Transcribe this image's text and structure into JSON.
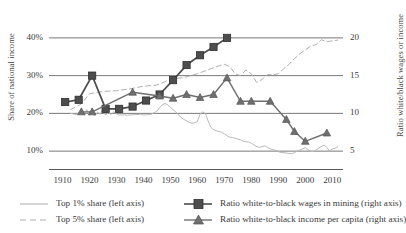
{
  "chart_data": {
    "type": "line",
    "title": "",
    "xlabel": "",
    "ylabel": "Share of national income",
    "y2label": "Ratio white/black wages or income",
    "xlim": [
      1905,
      2014
    ],
    "ylim": [
      5,
      45
    ],
    "y2lim": [
      2.5,
      22.5
    ],
    "grid": true,
    "legend_position": "bottom",
    "left_axis_ticks": [
      "40%",
      "30%",
      "20%",
      "10%"
    ],
    "left_axis_values": [
      40,
      30,
      20,
      10
    ],
    "right_axis_ticks": [
      "20",
      "15",
      "10",
      "5"
    ],
    "right_axis_values": [
      20,
      15,
      10,
      5
    ],
    "x_ticks": [
      "1910",
      "1920",
      "1930",
      "1940",
      "1950",
      "1960",
      "1970",
      "1980",
      "1990",
      "2000",
      "2010"
    ],
    "x_tick_values": [
      1910,
      1920,
      1930,
      1940,
      1950,
      1960,
      1970,
      1980,
      1990,
      2000,
      2010
    ],
    "series": [
      {
        "name": "Top 1% share (left axis)",
        "axis": "left",
        "style": "solid",
        "color": "#b9b9b9",
        "marker": "none",
        "units": "percent of national income",
        "x": [
          1913,
          1915,
          1917,
          1918,
          1919,
          1920,
          1921,
          1922,
          1923,
          1924,
          1925,
          1926,
          1927,
          1928,
          1929,
          1930,
          1931,
          1932,
          1933,
          1934,
          1935,
          1936,
          1937,
          1938,
          1939,
          1940,
          1941,
          1942,
          1943,
          1944,
          1945,
          1946,
          1947,
          1948,
          1949,
          1950,
          1951,
          1952,
          1953,
          1954,
          1955,
          1956,
          1957,
          1958,
          1959,
          1960,
          1961,
          1962,
          1963,
          1964,
          1965,
          1966,
          1967,
          1968,
          1969,
          1970,
          1971,
          1972,
          1973,
          1974,
          1975,
          1976,
          1977,
          1978,
          1979,
          1980,
          1981,
          1982,
          1983,
          1984,
          1985,
          1986,
          1987,
          1988,
          1989,
          1990,
          1991,
          1992,
          1993,
          1994,
          1995,
          1996,
          1997,
          1998,
          1999,
          2000,
          2001,
          2002,
          2003,
          2004,
          2005,
          2006,
          2007,
          2008,
          2009,
          2010,
          2011,
          2012
        ],
        "y": [
          20.0,
          19.7,
          20.4,
          19.6,
          21.0,
          19.5,
          21.3,
          19.4,
          20.3,
          19.8,
          21.4,
          19.6,
          20.2,
          19.7,
          20.4,
          19.9,
          19.5,
          19.6,
          19.6,
          19.5,
          19.6,
          19.6,
          19.7,
          19.7,
          19.8,
          19.6,
          19.6,
          19.7,
          19.8,
          20.2,
          20.6,
          21.5,
          22.3,
          22.6,
          22.3,
          21.6,
          21.0,
          20.4,
          19.6,
          18.9,
          18.4,
          18.0,
          17.6,
          17.4,
          17.5,
          17.8,
          19.8,
          20.4,
          19.9,
          18.0,
          16.3,
          15.7,
          15.4,
          15.2,
          15.0,
          14.6,
          14.1,
          13.7,
          13.6,
          13.4,
          13.2,
          13.0,
          12.6,
          12.5,
          12.4,
          12.1,
          11.6,
          11.2,
          11.0,
          11.2,
          11.4,
          11.0,
          10.6,
          10.4,
          10.2,
          9.9,
          9.6,
          9.6,
          9.5,
          9.4,
          9.3,
          9.6,
          10.0,
          10.3,
          10.6,
          10.9,
          10.4,
          10.0,
          9.9,
          10.3,
          10.8,
          11.2,
          11.6,
          11.0,
          10.0,
          10.6,
          10.7,
          11.2
        ]
      },
      {
        "name": "Top 5% share (left axis)",
        "axis": "left",
        "style": "dashed",
        "color": "#b0b0b0",
        "marker": "none",
        "units": "percent of national income",
        "note": "plotted against right-hand scale appearance in figure",
        "x": [
          1913,
          1917,
          1920,
          1925,
          1930,
          1935,
          1940,
          1945,
          1950,
          1955,
          1960,
          1965,
          1968,
          1970,
          1972,
          1974,
          1976,
          1978,
          1980,
          1982,
          1984,
          1986,
          1988,
          1990,
          1992,
          1994,
          1996,
          1998,
          2000,
          2002,
          2004,
          2006,
          2008,
          2010,
          2012
        ],
        "y": [
          21.0,
          22.5,
          25.2,
          25.8,
          26.0,
          26.5,
          27.2,
          27.5,
          29.0,
          29.5,
          30.5,
          31.8,
          32.6,
          33.0,
          32.4,
          30.5,
          30.0,
          31.5,
          30.5,
          28.2,
          29.0,
          30.3,
          30.2,
          30.5,
          31.8,
          33.0,
          34.5,
          35.8,
          36.8,
          37.8,
          38.2,
          39.5,
          39.0,
          39.2,
          39.4
        ]
      },
      {
        "name": "Ratio white-to-black wages in mining (right axis)",
        "axis": "right",
        "style": "solid",
        "color": "#4d4d4d",
        "marker": "square",
        "units": "ratio",
        "x": [
          1911,
          1916,
          1921,
          1926,
          1931,
          1936,
          1941,
          1946,
          1951,
          1956,
          1961,
          1966,
          1971
        ],
        "y": [
          11.5,
          11.8,
          15.0,
          10.6,
          10.6,
          10.9,
          11.7,
          12.5,
          14.4,
          16.4,
          17.7,
          18.8,
          20.0
        ]
      },
      {
        "name": "Ratio white-to-black income per capita (right axis)",
        "axis": "right",
        "style": "solid",
        "color": "#6f6f6f",
        "marker": "triangle",
        "units": "ratio",
        "x": [
          1917,
          1921,
          1936,
          1946,
          1951,
          1956,
          1961,
          1966,
          1971,
          1976,
          1980,
          1987,
          1993,
          1996,
          2000,
          2008
        ],
        "y": [
          10.2,
          10.2,
          12.8,
          12.3,
          12.0,
          12.5,
          12.1,
          12.5,
          14.7,
          11.6,
          11.6,
          11.6,
          9.2,
          7.6,
          6.3,
          7.4
        ]
      }
    ]
  },
  "axes": {
    "left_title": "Share of national income",
    "right_title": "Ratio white/black wages or income"
  },
  "legend": {
    "entries": [
      {
        "label": "Top 1% share (left axis)",
        "key": "line-solid-light"
      },
      {
        "label": "Top 5% share (left axis)",
        "key": "line-dashed-light"
      },
      {
        "label": "Ratio white-to-black wages in mining (right axis)",
        "key": "line-square-dark"
      },
      {
        "label": "Ratio white-to-black income per capita (right axis)",
        "key": "line-triangle-gray"
      }
    ]
  }
}
